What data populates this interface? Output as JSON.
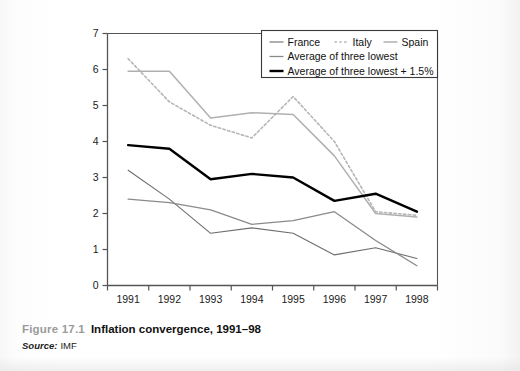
{
  "caption": {
    "figure_number": "Figure 17.1",
    "title": "Inflation convergence, 1991–98",
    "source_label": "Source:",
    "source_value": "IMF"
  },
  "legend": {
    "items": [
      {
        "label": "France",
        "color": "#6e6e6e",
        "style": "solid",
        "width": 1.1
      },
      {
        "label": "Italy",
        "color": "#b5b5b5",
        "style": "dotted",
        "width": 1.6
      },
      {
        "label": "Spain",
        "color": "#b0b0b0",
        "style": "solid",
        "width": 1.5
      },
      {
        "label": "Average of three lowest",
        "color": "#8a8a8a",
        "style": "solid",
        "width": 1.3
      },
      {
        "label": "Average of three lowest + 1.5%",
        "color": "#000000",
        "style": "solid",
        "width": 2.4
      }
    ]
  },
  "chart_data": {
    "type": "line",
    "title": "Inflation convergence, 1991–98",
    "xlabel": "",
    "ylabel": "",
    "x": [
      "1991",
      "1992",
      "1993",
      "1994",
      "1995",
      "1996",
      "1997",
      "1998"
    ],
    "xtick_labels": [
      "1991",
      "1992",
      "1993",
      "1994",
      "1995",
      "1996",
      "1997",
      "1998"
    ],
    "ytick_labels": [
      "0",
      "1",
      "2",
      "3",
      "4",
      "5",
      "6",
      "7"
    ],
    "yticks": [
      0,
      1,
      2,
      3,
      4,
      5,
      6,
      7
    ],
    "ylim": [
      0,
      7
    ],
    "grid": false,
    "legend_position": "top-right",
    "series": [
      {
        "name": "France",
        "color": "#6e6e6e",
        "style": "solid",
        "width": 1.1,
        "values": [
          3.2,
          2.4,
          1.45,
          1.6,
          1.45,
          0.85,
          1.05,
          0.75
        ]
      },
      {
        "name": "Italy",
        "color": "#b5b5b5",
        "style": "dotted",
        "width": 1.6,
        "values": [
          6.3,
          5.1,
          4.45,
          4.1,
          5.25,
          4.0,
          2.05,
          1.95
        ]
      },
      {
        "name": "Spain",
        "color": "#b0b0b0",
        "style": "solid",
        "width": 1.5,
        "values": [
          5.95,
          5.95,
          4.65,
          4.8,
          4.75,
          3.6,
          2.0,
          1.9
        ]
      },
      {
        "name": "Average of three lowest",
        "color": "#8a8a8a",
        "style": "solid",
        "width": 1.3,
        "values": [
          2.4,
          2.3,
          2.1,
          1.7,
          1.8,
          2.05,
          1.25,
          0.55
        ]
      },
      {
        "name": "Average of three lowest + 1.5%",
        "color": "#000000",
        "style": "solid",
        "width": 2.4,
        "values": [
          3.9,
          3.8,
          2.95,
          3.1,
          3.0,
          2.35,
          2.55,
          2.05
        ]
      }
    ]
  },
  "axes": {
    "axis_color": "#555555",
    "plot_background": "#ffffff"
  }
}
